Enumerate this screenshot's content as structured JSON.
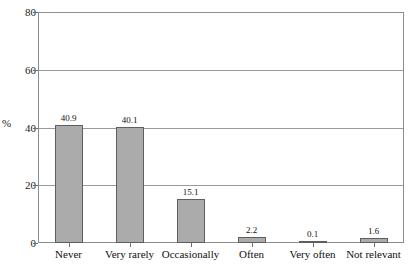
{
  "chart_data": {
    "type": "bar",
    "title": "",
    "title_note": "title clipped off top edge of screenshot, illegible",
    "categories": [
      "Never",
      "Very rarely",
      "Occasionally",
      "Often",
      "Very often",
      "Not relevant"
    ],
    "values": [
      40.9,
      40.1,
      15.1,
      2.2,
      0.1,
      1.6
    ],
    "value_labels": [
      "40.9",
      "40.1",
      "15.1",
      "2.2",
      "0.1",
      "1.6"
    ],
    "xlabel": "",
    "ylabel": "%",
    "ylim": [
      0,
      80
    ],
    "yticks": [
      0,
      20,
      40,
      60,
      80
    ],
    "ytick_labels": [
      "0",
      "20",
      "40",
      "60",
      "80"
    ],
    "grid": true,
    "grid_axis": "y",
    "legend": false,
    "bar_color": "#ababab",
    "bar_edge_color": "#5f5f5f",
    "axis_color": "#8d8d8d",
    "text_color": "#101010"
  }
}
